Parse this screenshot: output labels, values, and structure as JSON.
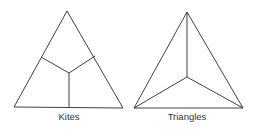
{
  "figures": [
    {
      "label": "Kites",
      "description": "Equilateral triangle divided into three kites by segments from the centroid to the side midpoints"
    },
    {
      "label": "Triangles",
      "description": "Equilateral triangle divided into three triangles by segments from the centroid to the vertices"
    }
  ],
  "colors": {
    "line": "#2a2a2a",
    "text": "#333333",
    "background": "#ffffff"
  }
}
